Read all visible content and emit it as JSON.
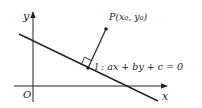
{
  "diagram": {
    "axes": {
      "x_label": "x",
      "y_label": "y",
      "origin_label": "O"
    },
    "point": {
      "label": "P(x₀, y₀)"
    },
    "line": {
      "label": "l : ax + by + c = 0"
    },
    "colors": {
      "stroke": "#222222",
      "background": "#ffffff"
    }
  }
}
